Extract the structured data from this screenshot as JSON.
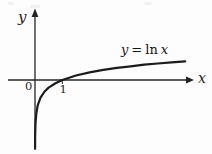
{
  "figure": {
    "y_axis_label": "y",
    "x_axis_label": "x",
    "origin_label": "0",
    "unit_tick_label": "1",
    "equation": {
      "lhs": "y",
      "rel": "=",
      "fn": "ln",
      "arg": "x"
    }
  },
  "chart_data": {
    "type": "line",
    "title": "",
    "function_label": "y = ln x",
    "xlabel": "x",
    "ylabel": "y",
    "origin_label": "0",
    "x_ticks": [
      1
    ],
    "x_tick_labels": [
      "1"
    ],
    "x": [
      0.002,
      0.005,
      0.01,
      0.02,
      0.05,
      0.1,
      0.2,
      0.35,
      0.5,
      0.75,
      1,
      1.5,
      2,
      2.5,
      3,
      3.5,
      4,
      4.5,
      5,
      5.5
    ],
    "y": [
      -6.21,
      -5.3,
      -4.61,
      -3.91,
      -3.0,
      -2.3,
      -1.61,
      -1.05,
      -0.69,
      -0.29,
      0,
      0.41,
      0.69,
      0.92,
      1.1,
      1.25,
      1.39,
      1.5,
      1.61,
      1.7
    ],
    "xlim": [
      -1,
      5.8
    ],
    "ylim": [
      -6.5,
      6.4
    ],
    "grid": false,
    "legend": null,
    "curve_color": "#1c1c1c",
    "axis_color": "#242424",
    "background_color": "#fdfdfd"
  }
}
